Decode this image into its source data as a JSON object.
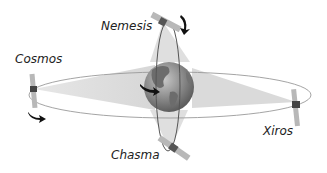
{
  "diagram": {
    "type": "orbital-diagram",
    "center_body": "earth-globe",
    "orbits": [
      {
        "name": "equatorial-orbit",
        "orientation": "horizontal"
      },
      {
        "name": "polar-orbit",
        "orientation": "vertical"
      }
    ],
    "satellites": [
      {
        "name": "Nemesis",
        "orbit": "polar-orbit",
        "position": "top"
      },
      {
        "name": "Cosmos",
        "orbit": "equatorial-orbit",
        "position": "left"
      },
      {
        "name": "Xiros",
        "orbit": "equatorial-orbit",
        "position": "right"
      },
      {
        "name": "Chasma",
        "orbit": "polar-orbit",
        "position": "bottom"
      }
    ],
    "labels": {
      "nemesis": "Nemesis",
      "cosmos": "Cosmos",
      "xiros": "Xiros",
      "chasma": "Chasma"
    },
    "colors": {
      "orbit_line": "#999999",
      "polar_orbit_line": "#555555",
      "beam_fill": "#d8d8d8",
      "panel": "#b0b0b0",
      "satellite_body": "#444444",
      "arrow": "#111111",
      "globe_ocean": "#8a8a8a",
      "globe_land": "#6a6a6a"
    }
  }
}
